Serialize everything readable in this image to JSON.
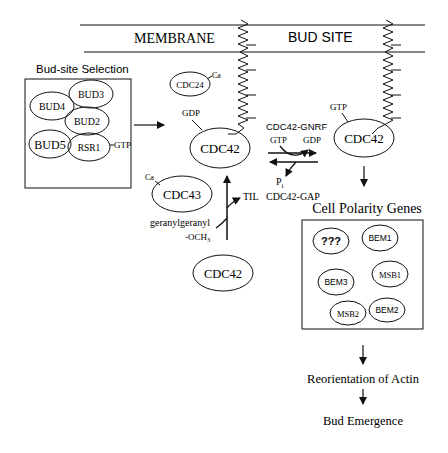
{
  "membrane": {
    "left_label": "MEMBRANE",
    "right_label": "BUD SITE"
  },
  "bud_site_selection": {
    "title": "Bud-site Selection",
    "proteins": [
      "BUD4",
      "BUD3",
      "BUD2",
      "BUD5",
      "RSR1"
    ],
    "rsr1_bound": "GTP"
  },
  "cdc24": {
    "label": "CDC24",
    "bound": "Ca"
  },
  "cdc42_gdp": {
    "label": "CDC42",
    "bound": "GDP"
  },
  "cdc42_gtp": {
    "label": "CDC42",
    "bound": "GTP"
  },
  "exchange": {
    "gnrf_label": "CDC42-GNRF",
    "gtp_in": "GTP",
    "gdp_out": "GDP",
    "pi_label": "P",
    "pi_sub": "i",
    "gap_label": "CDC42-GAP"
  },
  "cdc43": {
    "label": "CDC43",
    "bound": "Ca"
  },
  "prenylation": {
    "til_label": "TIL",
    "geranyl_label": "geranylgeranyl",
    "och3_label": "-OCH",
    "och3_sub": "3"
  },
  "cdc42_unmodified": {
    "label": "CDC42"
  },
  "cell_polarity": {
    "title": "Cell Polarity Genes",
    "proteins": [
      "???",
      "BEM1",
      "BEM3",
      "MSB1",
      "MSB2",
      "BEM2"
    ]
  },
  "downstream": {
    "step1": "Reorientation of Actin",
    "step2": "Bud Emergence"
  }
}
